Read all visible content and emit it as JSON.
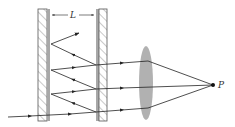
{
  "diagram": {
    "labels": {
      "spacing": "L",
      "focal_point": "P"
    },
    "colors": {
      "line": "#222222",
      "plate_hatch": "#555555",
      "plate_coating": "#a8a8a8",
      "lens": "#a9a9a9",
      "background": "#ffffff"
    },
    "components": [
      {
        "name": "left-plate",
        "type": "partially-reflecting-plate"
      },
      {
        "name": "right-plate",
        "type": "partially-reflecting-plate"
      },
      {
        "name": "lens",
        "type": "converging-lens"
      },
      {
        "name": "focal-point",
        "type": "point",
        "label": "P"
      }
    ],
    "rays": [
      {
        "name": "incident-ray"
      },
      {
        "name": "transmitted-ray-1"
      },
      {
        "name": "transmitted-ray-2"
      },
      {
        "name": "transmitted-ray-3"
      },
      {
        "name": "reflected-rays"
      }
    ]
  }
}
